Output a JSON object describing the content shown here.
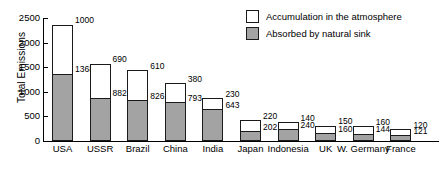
{
  "chart_data": {
    "type": "bar",
    "stacked": true,
    "title": "",
    "subtitle": "",
    "xlabel": "",
    "ylabel": "Total Emissions",
    "ylim": [
      0,
      2500
    ],
    "yticks": [
      0,
      500,
      1000,
      1500,
      2000,
      2500
    ],
    "ytick_labels": [
      "0",
      "500",
      "1000",
      "1500",
      "2000",
      "2500"
    ],
    "grid": false,
    "legend_position": "top-right",
    "categories": [
      "USA",
      "USSR",
      "Brazil",
      "China",
      "India",
      "Japan",
      "Indonesia",
      "UK",
      "W. Germany",
      "France"
    ],
    "series": [
      {
        "name": "Absorbed by natural sink",
        "color": "#a3a3a3",
        "values": [
          1368,
          882,
          826,
          793,
          643,
          202,
          240,
          160,
          144,
          121
        ]
      },
      {
        "name": "Accumulation in the atmosphere",
        "color": "#ffffff",
        "values": [
          1000,
          690,
          610,
          380,
          230,
          220,
          140,
          150,
          160,
          120
        ]
      }
    ],
    "totals": [
      2368,
      1572,
      1436,
      1173,
      873,
      422,
      380,
      310,
      304,
      241
    ],
    "data_labels": [
      {
        "category": "USA",
        "accumulation": "1000",
        "absorbed": "1368"
      },
      {
        "category": "USSR",
        "accumulation": "690",
        "absorbed": "882"
      },
      {
        "category": "Brazil",
        "accumulation": "610",
        "absorbed": "826"
      },
      {
        "category": "China",
        "accumulation": "380",
        "absorbed": "793"
      },
      {
        "category": "India",
        "accumulation": "230",
        "absorbed": "643"
      },
      {
        "category": "Japan",
        "accumulation": "220",
        "absorbed": "202"
      },
      {
        "category": "Indonesia",
        "accumulation": "140",
        "absorbed": "240"
      },
      {
        "category": "UK",
        "accumulation": "150",
        "absorbed": "160"
      },
      {
        "category": "W. Germany",
        "accumulation": "160",
        "absorbed": "144"
      },
      {
        "category": "France",
        "accumulation": "120",
        "absorbed": "121"
      }
    ],
    "legend": [
      {
        "label": "Accumulation in the atmosphere",
        "swatch": "white"
      },
      {
        "label": "Absorbed by natural sink",
        "swatch": "gray"
      }
    ]
  }
}
